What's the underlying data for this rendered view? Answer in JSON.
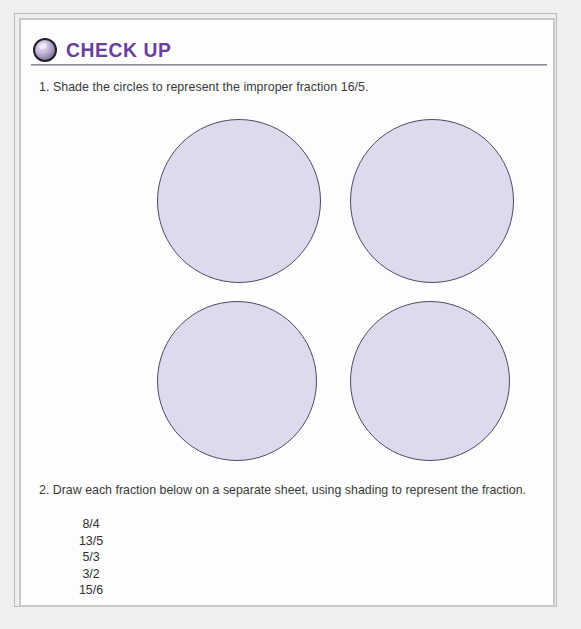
{
  "worksheet": {
    "header": {
      "icon": "checkup-sphere-icon",
      "title": "CHECK UP",
      "title_color": "#6b3f9e"
    },
    "questions": [
      {
        "number": "1.",
        "text": "1. Shade the circles to represent the improper fraction 16/5."
      },
      {
        "number": "2.",
        "text": "2. Draw each fraction below on a separate sheet, using shading to represent the fraction."
      }
    ],
    "circles": {
      "count": 4,
      "rows": 2,
      "columns": 2,
      "fill_color": "#ded9ec",
      "stroke_color": "#514a63",
      "shaded_fraction": "16/5",
      "items": [
        {
          "label": "circle-1"
        },
        {
          "label": "circle-2"
        },
        {
          "label": "circle-3"
        },
        {
          "label": "circle-4"
        }
      ]
    },
    "fraction_list": [
      "8/4",
      "13/5",
      "5/3",
      "3/2",
      "15/6"
    ]
  }
}
